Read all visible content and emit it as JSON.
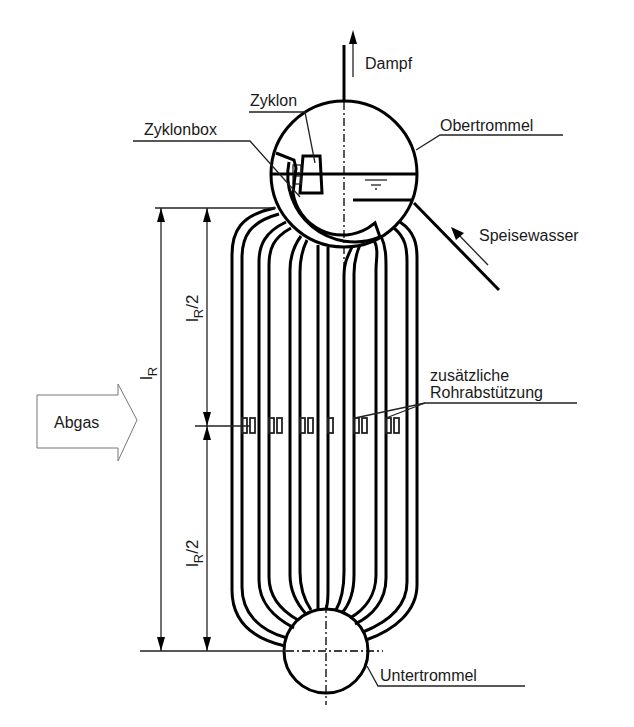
{
  "diagram": {
    "labels": {
      "dampf": "Dampf",
      "zyklon": "Zyklon",
      "obertrommel": "Obertrommel",
      "zyklonbox": "Zyklonbox",
      "speisewasser": "Speisewasser",
      "zusaetzliche": "zusätzliche",
      "rohrabstuetzung": "Rohrabstützung",
      "abgas": "Abgas",
      "untertrommel": "Untertrommel",
      "lr_main": "l",
      "lr_sub": "R",
      "lr_half_main": "l",
      "lr_half_sub": "R",
      "lr_half_suffix": "/2"
    },
    "colors": {
      "stroke": "#000000",
      "background": "#ffffff",
      "text": "#1a1a1a"
    }
  }
}
